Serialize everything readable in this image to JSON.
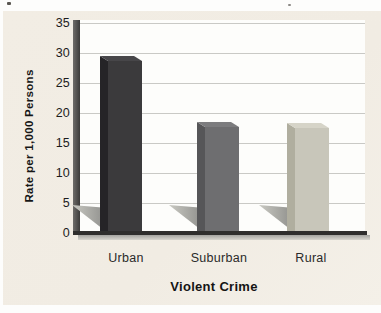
{
  "figure": {
    "background_color": "#f1ece3",
    "plot_background": "#fdfdfb",
    "grid_color": "#c9c9c5",
    "axis_color": "#2f2e2d"
  },
  "chart_data": {
    "type": "bar",
    "title": "",
    "xlabel": "Violent Crime",
    "ylabel": "Rate per 1,000 Persons",
    "categories": [
      "Urban",
      "Suburban",
      "Rural"
    ],
    "values": [
      29.5,
      18.5,
      18.3
    ],
    "ylim": [
      0,
      35
    ],
    "yticks": [
      0,
      5,
      10,
      15,
      20,
      25,
      30,
      35
    ],
    "grid": "horizontal, every 5 units",
    "legend": "none",
    "bar_style": "3d-column with cast floor shadow",
    "bar_colors": [
      {
        "name": "Urban",
        "front": "#3b3a3c",
        "side": "#252427",
        "top": "#474649"
      },
      {
        "name": "Suburban",
        "front": "#6e6e70",
        "side": "#565658",
        "top": "#7c7c7e"
      },
      {
        "name": "Rural",
        "front": "#c8c6ba",
        "side": "#b0ae9f",
        "top": "#d6d4c8"
      }
    ],
    "shadow_colors": {
      "near_bar": "#8b8b88",
      "apex": "#c9c9c2"
    }
  }
}
